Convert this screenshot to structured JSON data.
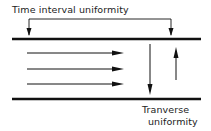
{
  "diagram": {
    "labels": {
      "time_interval": "Time interval uniformity",
      "transverse_line1": "Tranverse",
      "transverse_line2": "uniformity"
    },
    "elements": {
      "boundaries": [
        "top-plate",
        "bottom-plate"
      ],
      "flow_arrows_count": 3,
      "transverse_arrows": [
        "down",
        "up"
      ]
    },
    "colors": {
      "ink": "#111111",
      "background": "#ffffff"
    }
  }
}
